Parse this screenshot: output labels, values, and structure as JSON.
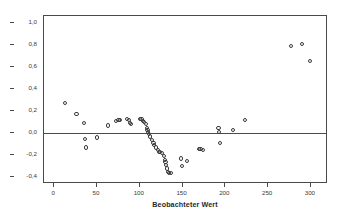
{
  "chart_data": {
    "type": "scatter",
    "title": "",
    "xlabel": "Beobachteter Wert",
    "ylabel": "Beobachteter Normalwert",
    "xlim": [
      -12,
      320
    ],
    "ylim": [
      -0.46,
      1.06
    ],
    "grid": false,
    "legend": null,
    "reference_line": {
      "type": "horizontal",
      "y": 0.0
    },
    "xticks": [
      0,
      50,
      100,
      150,
      200,
      250,
      300
    ],
    "xtick_labels": [
      "0",
      "50",
      "100",
      "150",
      "200",
      "250",
      "300"
    ],
    "yticks": [
      1.0,
      0.8,
      0.6,
      0.4,
      0.2,
      0.0,
      -0.2,
      -0.4
    ],
    "ytick_labels": [
      "1,0",
      "0,8",
      "0,6",
      "0,4",
      "0,2",
      "0,0",
      "-0,2",
      "-0,4"
    ],
    "marker": "open-circle",
    "marker_color": "#3a3a3a",
    "points": [
      {
        "x": 13,
        "y": 0.27
      },
      {
        "x": 26,
        "y": 0.17
      },
      {
        "x": 35,
        "y": 0.09
      },
      {
        "x": 36,
        "y": -0.05
      },
      {
        "x": 37,
        "y": -0.13
      },
      {
        "x": 50,
        "y": -0.04
      },
      {
        "x": 63,
        "y": 0.07
      },
      {
        "x": 72,
        "y": 0.11
      },
      {
        "x": 75,
        "y": 0.12
      },
      {
        "x": 77,
        "y": 0.12
      },
      {
        "x": 85,
        "y": 0.13
      },
      {
        "x": 87,
        "y": 0.12
      },
      {
        "x": 89,
        "y": 0.09
      },
      {
        "x": 90,
        "y": 0.08
      },
      {
        "x": 100,
        "y": 0.13
      },
      {
        "x": 102,
        "y": 0.13
      },
      {
        "x": 104,
        "y": 0.11
      },
      {
        "x": 105,
        "y": 0.1
      },
      {
        "x": 107,
        "y": 0.08
      },
      {
        "x": 108,
        "y": 0.05
      },
      {
        "x": 109,
        "y": 0.03
      },
      {
        "x": 110,
        "y": 0.01
      },
      {
        "x": 111,
        "y": -0.01
      },
      {
        "x": 112,
        "y": -0.03
      },
      {
        "x": 114,
        "y": -0.06
      },
      {
        "x": 116,
        "y": -0.09
      },
      {
        "x": 117,
        "y": -0.11
      },
      {
        "x": 119,
        "y": -0.13
      },
      {
        "x": 121,
        "y": -0.15
      },
      {
        "x": 122,
        "y": -0.17
      },
      {
        "x": 124,
        "y": -0.17
      },
      {
        "x": 126,
        "y": -0.18
      },
      {
        "x": 128,
        "y": -0.21
      },
      {
        "x": 129,
        "y": -0.24
      },
      {
        "x": 130,
        "y": -0.26
      },
      {
        "x": 131,
        "y": -0.29
      },
      {
        "x": 132,
        "y": -0.32
      },
      {
        "x": 133,
        "y": -0.35
      },
      {
        "x": 134,
        "y": -0.36
      },
      {
        "x": 136,
        "y": -0.36
      },
      {
        "x": 148,
        "y": -0.23
      },
      {
        "x": 149,
        "y": -0.3
      },
      {
        "x": 155,
        "y": -0.25
      },
      {
        "x": 169,
        "y": -0.14
      },
      {
        "x": 171,
        "y": -0.14
      },
      {
        "x": 174,
        "y": -0.15
      },
      {
        "x": 192,
        "y": 0.05
      },
      {
        "x": 193,
        "y": 0.01
      },
      {
        "x": 194,
        "y": -0.09
      },
      {
        "x": 209,
        "y": 0.03
      },
      {
        "x": 223,
        "y": 0.12
      },
      {
        "x": 277,
        "y": 0.79
      },
      {
        "x": 290,
        "y": 0.81
      },
      {
        "x": 299,
        "y": 0.65
      }
    ]
  }
}
